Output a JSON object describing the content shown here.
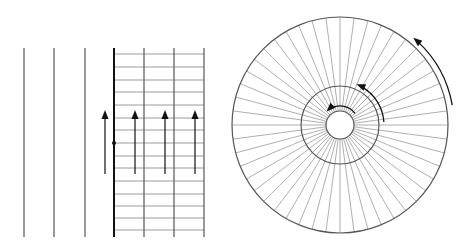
{
  "figure": {
    "colors": {
      "background": "#ffffff",
      "line": "#555555",
      "thin_line": "#9a9a9a",
      "thick_line": "#111111",
      "arrow": "#111111"
    }
  },
  "left_panel": {
    "top": 48,
    "bottom": 237,
    "plain_lines_x": [
      24,
      54,
      85
    ],
    "boundary_line_x": 114,
    "grid_lines_x": [
      144,
      174,
      204
    ],
    "grid_right": 204,
    "horizontal_lines_y": [
      54,
      67,
      80,
      92,
      105,
      118,
      130,
      143,
      156,
      168,
      181,
      194,
      206,
      218,
      230
    ],
    "marker_dot": {
      "x": 114,
      "y": 143,
      "r": 2
    },
    "arrows": [
      {
        "x": 105,
        "y_tail": 174,
        "y_tip": 110
      },
      {
        "x": 135,
        "y_tail": 174,
        "y_tip": 110
      },
      {
        "x": 165,
        "y_tail": 174,
        "y_tip": 110
      },
      {
        "x": 195,
        "y_tail": 174,
        "y_tip": 110
      }
    ]
  },
  "right_panel": {
    "center": {
      "x": 340,
      "y": 125
    },
    "outer_radius": 108,
    "middle_radius": 39,
    "inner_radius": 14,
    "spoke_count": 48,
    "circulation_arrows": [
      {
        "name": "outer",
        "radius": 114,
        "start_deg": 10,
        "end_deg": 50
      },
      {
        "name": "middle",
        "radius": 44,
        "start_deg": 4,
        "end_deg": 68
      },
      {
        "name": "inner",
        "radius": 19,
        "start_deg": 38,
        "end_deg": 135
      }
    ]
  }
}
